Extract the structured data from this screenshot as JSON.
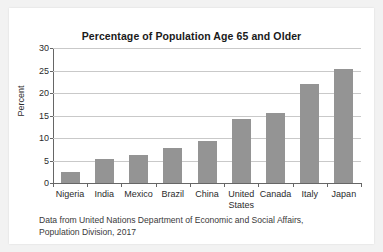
{
  "chart_data": {
    "type": "bar",
    "title": "Percentage of Population Age 65 and Older",
    "xlabel": "",
    "ylabel": "Percent",
    "ylim": [
      0,
      30
    ],
    "ytick_labels": [
      "0",
      "5",
      "10",
      "15",
      "20",
      "25",
      "30"
    ],
    "yticks": [
      0,
      5,
      10,
      15,
      20,
      25,
      30
    ],
    "grid": "horizontal",
    "legend": "none",
    "bar_color": "#949494",
    "categories": [
      "Nigeria",
      "India",
      "Mexico",
      "Brazil",
      "China",
      "United\nStates",
      "Canada",
      "Italy",
      "Japan"
    ],
    "values": [
      2.5,
      5.4,
      6.2,
      7.7,
      9.4,
      14.2,
      15.6,
      21.9,
      25.4
    ],
    "source_note": "Data from United Nations Department of Economic and Social Affairs, Population Division, 2017"
  }
}
